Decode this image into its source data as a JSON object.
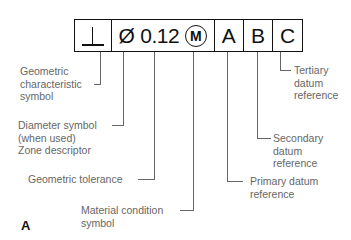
{
  "frame": {
    "geometric_characteristic": "⊥",
    "diameter_symbol": "Ø",
    "tolerance": "0.12",
    "material_condition": "M",
    "datum_primary": "A",
    "datum_secondary": "B",
    "datum_tertiary": "C"
  },
  "labels": {
    "geometric_characteristic": "Geometric\ncharacteristic\nsymbol",
    "diameter": "Diameter symbol\n(when used)\nZone descriptor",
    "geometric_tolerance": "Geometric tolerance",
    "material_condition": "Material condition\nsymbol",
    "primary_datum": "Primary datum\nreference",
    "secondary_datum": "Secondary\ndatum\nreference",
    "tertiary_datum": "Tertiary\ndatum\nreference"
  },
  "figure_label": "A",
  "colors": {
    "frame": "#111111",
    "annotation": "#666666"
  }
}
